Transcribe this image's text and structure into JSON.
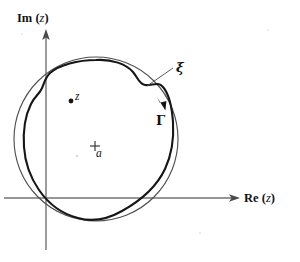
{
  "figure": {
    "background_color": "#ffffff",
    "axes": {
      "y_axis": {
        "name": "imaginary-axis",
        "label_prefix": "Im",
        "label_variable": "z",
        "label_text": "Im (z)",
        "color": "#737373"
      },
      "x_axis": {
        "name": "real-axis",
        "label_prefix": "Re",
        "label_variable": "z",
        "label_text": "Re (z)",
        "color": "#737373"
      },
      "origin_px": [
        46,
        198
      ]
    },
    "curves": {
      "outer": {
        "name": "xi-circle",
        "label": "ξ",
        "description": "smooth circle",
        "color": "#4f4f4f",
        "stroke_width": 1.15,
        "center_px": [
          96,
          139
        ],
        "radius_px": 82
      },
      "inner": {
        "name": "gamma-contour",
        "label": "Γ",
        "description": "wavy closed contour traversed clockwise",
        "color": "#161616",
        "stroke_width": 2.1,
        "direction": "clockwise"
      }
    },
    "points": [
      {
        "name": "point-z",
        "label": "z",
        "marker": "filled-dot",
        "position_px": [
          71,
          101
        ]
      },
      {
        "name": "point-a",
        "label": "a",
        "marker": "plus",
        "position_px": [
          95,
          146
        ]
      }
    ],
    "annotations": [
      {
        "name": "xi-leader",
        "label": "ξ",
        "from_px": [
          173,
          68
        ],
        "to_px": [
          150,
          84
        ]
      },
      {
        "name": "gamma-direction-arrow",
        "label": "Γ",
        "at_px": [
          161,
          103
        ],
        "points": "down-right"
      }
    ]
  }
}
